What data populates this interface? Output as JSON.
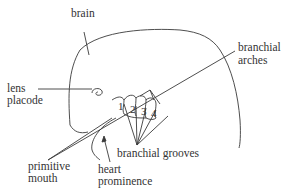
{
  "diagram": {
    "labels": {
      "brain": "brain",
      "branchial_arches_1": "branchial",
      "branchial_arches_2": "arches",
      "lens_placode_1": "lens",
      "lens_placode_2": "placode",
      "primitive_mouth_1": "primitive",
      "primitive_mouth_2": "mouth",
      "heart_prominence_1": "heart",
      "heart_prominence_2": "prominence",
      "branchial_grooves": "branchial grooves"
    },
    "arch_numbers": [
      "1",
      "2",
      "3",
      "4"
    ],
    "colors": {
      "line": "#3a3a3a",
      "text": "#333333",
      "background": "#ffffff"
    }
  }
}
